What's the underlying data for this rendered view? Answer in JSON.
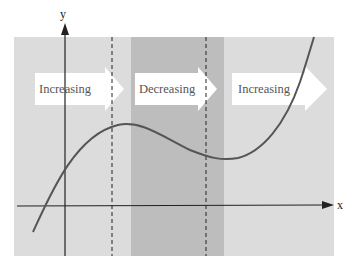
{
  "diagram": {
    "axes": {
      "x_label": "x",
      "y_label": "y"
    },
    "regions": [
      {
        "label": "Increasing",
        "color": "#dcdcdc"
      },
      {
        "label": "Decreasing",
        "color": "#bcbcbc"
      },
      {
        "label": "Increasing",
        "color": "#dcdcdc"
      }
    ],
    "colors": {
      "background": "#ffffff",
      "light_region": "#dcdcdc",
      "dark_region": "#bcbcbc",
      "curve": "#555555",
      "axes": "#222222",
      "arrow_fill": "#ffffff"
    }
  }
}
